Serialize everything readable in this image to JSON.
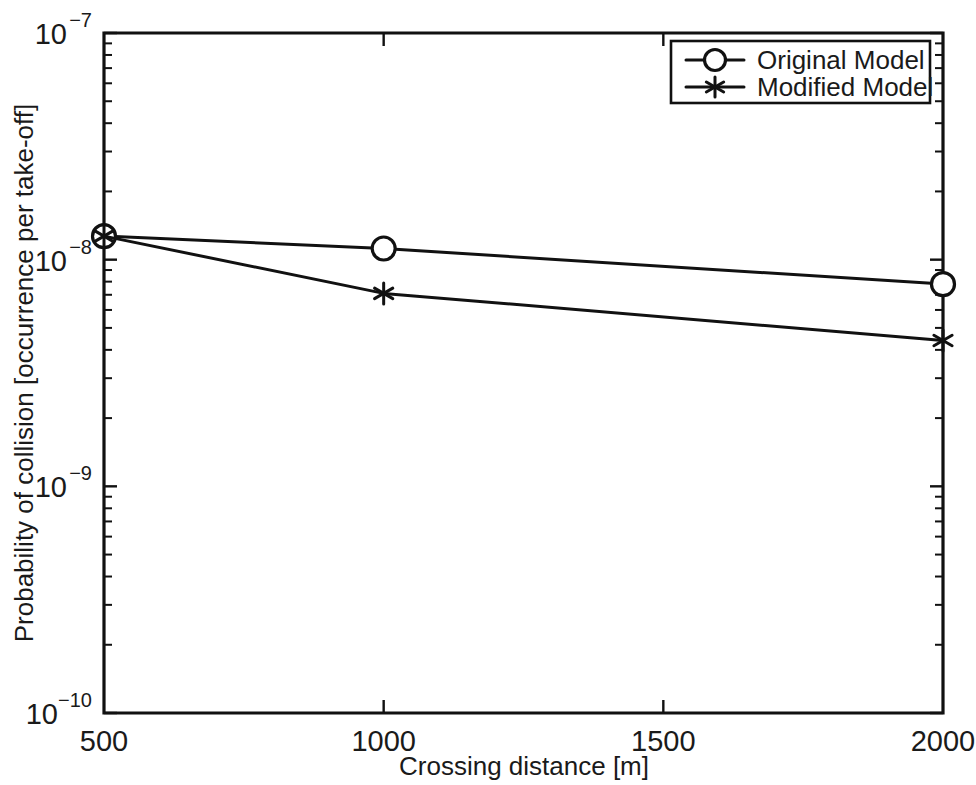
{
  "chart_data": {
    "type": "line",
    "title": "",
    "xlabel": "Crossing distance [m]",
    "ylabel": "Probability of collision [occurrence per take-off]",
    "x": [
      500,
      1000,
      2000
    ],
    "xlim": [
      500,
      2000
    ],
    "ylim": [
      1e-10,
      1e-07
    ],
    "yscale": "log",
    "xticks": [
      500,
      1000,
      1500,
      2000
    ],
    "xticklabels": [
      "500",
      "1000",
      "1500",
      "2000"
    ],
    "yticks": [
      1e-07,
      1e-08,
      1e-09,
      1e-10
    ],
    "yticklabels": [
      "10-7",
      "10-8",
      "10-9",
      "10-10"
    ],
    "grid": false,
    "legend_position": "top-right",
    "series": [
      {
        "name": "Original Model",
        "marker": "circle",
        "values": [
          1.27e-08,
          1.12e-08,
          7.8e-09
        ]
      },
      {
        "name": "Modified Model",
        "marker": "asterisk",
        "values": [
          1.27e-08,
          7.1e-09,
          4.4e-09
        ]
      }
    ]
  },
  "axes": {
    "y_label": "Probability of collision [occurrence per take-off]",
    "x_label": "Crossing distance [m]",
    "y_tick_labels": [
      {
        "base": "10",
        "exp": "−7"
      },
      {
        "base": "10",
        "exp": "−8"
      },
      {
        "base": "10",
        "exp": "−9"
      },
      {
        "base": "10",
        "exp": "−10"
      }
    ],
    "x_tick_labels": [
      "500",
      "1000",
      "1500",
      "2000"
    ]
  },
  "legend": {
    "entries": [
      {
        "label": "Original Model",
        "marker": "circle"
      },
      {
        "label": "Modified Model",
        "marker": "asterisk"
      }
    ]
  },
  "colors": {
    "line": "#111111",
    "background": "#ffffff",
    "text": "#1a1a1a"
  }
}
